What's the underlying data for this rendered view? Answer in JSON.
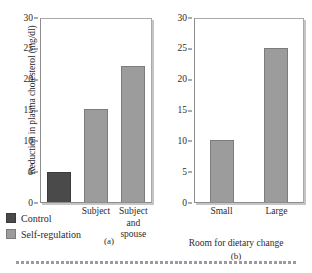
{
  "chart_data": [
    {
      "type": "bar",
      "panel": "(a)",
      "title": "",
      "xlabel": "",
      "ylabel": "Reduction in plasma cholesterol (mg/dl)",
      "ylim": [
        0,
        30
      ],
      "yticks": [
        0,
        5,
        10,
        15,
        20,
        25,
        30
      ],
      "ytick_labels": [
        "0",
        "5",
        "10",
        "15",
        "20",
        "25",
        "30"
      ],
      "grid": false,
      "categories": [
        "",
        "Subject",
        "Subject and spouse"
      ],
      "category_lines": [
        [
          "",
          "",
          ""
        ],
        [
          "Subject",
          "",
          ""
        ],
        [
          "Subject",
          "and",
          "spouse"
        ]
      ],
      "values": [
        5.0,
        15.2,
        22.3
      ],
      "bar_groups": [
        "Control",
        "Self-regulation",
        "Self-regulation"
      ],
      "legend": {
        "position": "below-left",
        "entries": [
          {
            "label": "Control",
            "color": "#4a4a4a"
          },
          {
            "label": "Self-regulation",
            "color": "#9c9c9c"
          }
        ]
      }
    },
    {
      "type": "bar",
      "panel": "(b)",
      "title": "",
      "xlabel": "Room for dietary change",
      "ylabel": "",
      "ylim": [
        0,
        30
      ],
      "yticks": [
        0,
        5,
        10,
        15,
        20,
        25,
        30
      ],
      "ytick_labels": [
        "0",
        "5",
        "10",
        "15",
        "20",
        "25",
        "30"
      ],
      "grid": false,
      "categories": [
        "Small",
        "Large"
      ],
      "values": [
        10.2,
        25.3
      ],
      "bar_groups": [
        "Self-regulation",
        "Self-regulation"
      ],
      "legend": {
        "position": "none",
        "entries": []
      }
    }
  ],
  "panel_a": {
    "y_axis_title": "Reduction in plasma cholesterol (mg/dl)",
    "y_ticks": [
      "30",
      "25",
      "20",
      "15",
      "10",
      "5",
      "0"
    ],
    "bars": [
      {
        "name": "control",
        "value": 5.0,
        "style": "dark",
        "label_l1": "",
        "label_l2": "",
        "label_l3": ""
      },
      {
        "name": "subject",
        "value": 15.2,
        "style": "light",
        "label_l1": "Subject",
        "label_l2": "",
        "label_l3": ""
      },
      {
        "name": "subject-and-spouse",
        "value": 22.3,
        "style": "light",
        "label_l1": "Subject",
        "label_l2": "and",
        "label_l3": "spouse"
      }
    ],
    "panel_letter": "(a)"
  },
  "panel_b": {
    "y_ticks": [
      "30",
      "25",
      "20",
      "15",
      "10",
      "5",
      "0"
    ],
    "x_axis_title": "Room for dietary change",
    "bars": [
      {
        "name": "small",
        "value": 10.2,
        "style": "light",
        "label_l1": "Small",
        "label_l2": "",
        "label_l3": ""
      },
      {
        "name": "large",
        "value": 25.3,
        "style": "light",
        "label_l1": "Large",
        "label_l2": "",
        "label_l3": ""
      }
    ],
    "panel_letter": "(b)"
  },
  "legend": {
    "entries": [
      {
        "label": "Control",
        "style": "dark"
      },
      {
        "label": "Self-regulation",
        "style": "light"
      }
    ]
  },
  "colors": {
    "control": "#4a4a4a",
    "self_regulation": "#9c9c9c",
    "axis": "#5a5a5a",
    "frame": "#8d8d8d",
    "dot_rule": "#9a9aa6"
  }
}
